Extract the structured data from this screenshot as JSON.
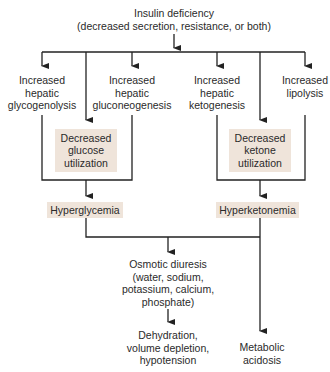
{
  "diagram": {
    "root": {
      "lines": [
        "Insulin deficiency",
        "(decreased secretion, resistance, or both)"
      ]
    },
    "top_row": [
      {
        "id": "glycogenolysis",
        "lines": [
          "Increased",
          "hepatic",
          "glycogenolysis"
        ]
      },
      {
        "id": "gluconeogenesis",
        "lines": [
          "Increased",
          "hepatic",
          "gluconeogenesis"
        ]
      },
      {
        "id": "ketogenesis",
        "lines": [
          "Increased",
          "hepatic",
          "ketogenesis"
        ]
      },
      {
        "id": "lipolysis",
        "lines": [
          "Increased",
          "lipolysis"
        ]
      }
    ],
    "mid_boxes": [
      {
        "id": "decreased-glucose-utilization",
        "lines": [
          "Decreased",
          "glucose",
          "utilization"
        ]
      },
      {
        "id": "decreased-ketone-utilization",
        "lines": [
          "Decreased",
          "ketone",
          "utilization"
        ]
      }
    ],
    "result_boxes": [
      {
        "id": "hyperglycemia",
        "label": "Hyperglycemia"
      },
      {
        "id": "hyperketonemia",
        "label": "Hyperketonemia"
      }
    ],
    "osmotic_diuresis": {
      "lines": [
        "Osmotic diuresis",
        "(water, sodium,",
        "potassium, calcium,",
        "phosphate)"
      ]
    },
    "dehydration": {
      "lines": [
        "Dehydration,",
        "volume depletion,",
        "hypotension"
      ]
    },
    "metabolic_acidosis": {
      "lines": [
        "Metabolic",
        "acidosis"
      ]
    },
    "colors": {
      "box_fill": "#efe4da",
      "line": "#222222",
      "text": "#2a2a2a"
    }
  }
}
